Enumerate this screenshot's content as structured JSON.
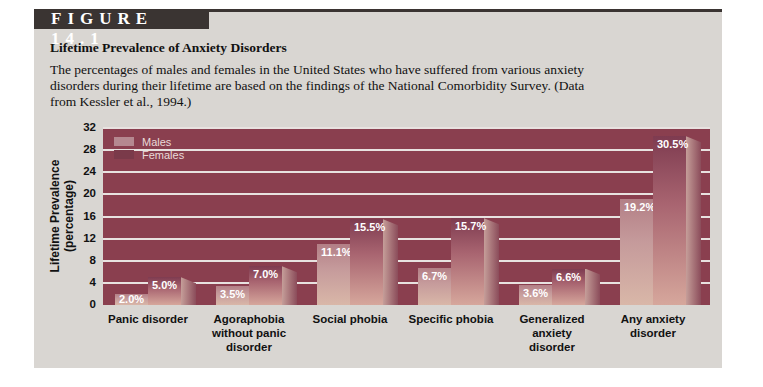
{
  "figure": {
    "label": "FIGURE 14.1",
    "title": "Lifetime Prevalence of Anxiety Disorders",
    "description": "The percentages of males and females in the United States who have suffered from various anxiety disorders during their lifetime are based on the findings of the National Comorbidity Survey. (Data from Kessler et al., 1994.)"
  },
  "colors": {
    "plot_background": "#8a3f4f",
    "males": "#c59a9b",
    "females": "#a86470",
    "panel": "#d9d6d2"
  },
  "legend": {
    "males": "Males",
    "females": "Females"
  },
  "axis": {
    "ylabel_line1": "Lifetime Prevalence",
    "ylabel_line2": "(percentage)",
    "ticks": [
      "0",
      "4",
      "8",
      "12",
      "16",
      "20",
      "24",
      "28",
      "32"
    ]
  },
  "categories": [
    {
      "label": "Panic disorder",
      "males": 2.0,
      "females": 5.0,
      "males_label": "2.0%",
      "females_label": "5.0%"
    },
    {
      "label": "Agoraphobia without panic disorder",
      "males": 3.5,
      "females": 7.0,
      "males_label": "3.5%",
      "females_label": "7.0%"
    },
    {
      "label": "Social phobia",
      "males": 11.1,
      "females": 15.5,
      "males_label": "11.1%",
      "females_label": "15.5%"
    },
    {
      "label": "Specific phobia",
      "males": 6.7,
      "females": 15.7,
      "males_label": "6.7%",
      "females_label": "15.7%"
    },
    {
      "label": "Generalized anxiety disorder",
      "males": 3.6,
      "females": 6.6,
      "males_label": "3.6%",
      "females_label": "6.6%"
    },
    {
      "label": "Any anxiety disorder",
      "males": 19.2,
      "females": 30.5,
      "males_label": "19.2%",
      "females_label": "30.5%"
    }
  ],
  "chart_data": {
    "type": "bar",
    "title": "Lifetime Prevalence of Anxiety Disorders",
    "subtitle": "The percentages of males and females in the United States who have suffered from various anxiety disorders during their lifetime are based on the findings of the National Comorbidity Survey. (Data from Kessler et al., 1994.)",
    "categories": [
      "Panic disorder",
      "Agoraphobia without panic disorder",
      "Social phobia",
      "Specific phobia",
      "Generalized anxiety disorder",
      "Any anxiety disorder"
    ],
    "series": [
      {
        "name": "Males",
        "values": [
          2.0,
          3.5,
          11.1,
          6.7,
          3.6,
          19.2
        ]
      },
      {
        "name": "Females",
        "values": [
          5.0,
          7.0,
          15.5,
          15.7,
          6.6,
          30.5
        ]
      }
    ],
    "xlabel": "",
    "ylabel": "Lifetime Prevalence (percentage)",
    "ylim": [
      0,
      32
    ],
    "yticks": [
      0,
      4,
      8,
      12,
      16,
      20,
      24,
      28,
      32
    ],
    "grid": true,
    "legend_position": "top-left inside plot"
  }
}
